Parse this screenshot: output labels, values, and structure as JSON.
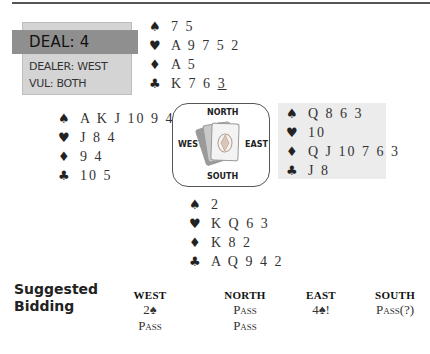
{
  "deal": {
    "title": "DEAL: 4",
    "dealer": "DEALER: WEST",
    "vul": "VUL: BOTH"
  },
  "icons": {
    "spade": "♠",
    "heart": "♥",
    "diamond": "♦",
    "club": "♣"
  },
  "hands": {
    "north": {
      "spades": "7 5",
      "hearts": "A 9 7 5 2",
      "diamonds": "A 5",
      "clubs_prefix": "K 7 6 ",
      "clubs_underlined": "3"
    },
    "west": {
      "spades": "A K J 10 9 4",
      "hearts": "J 8 4",
      "diamonds": "9 4",
      "clubs": "10 5"
    },
    "east": {
      "spades": "Q 8 6 3",
      "hearts": "10",
      "diamonds": "Q J 10 7 6 3",
      "clubs": "J 8"
    },
    "south": {
      "spades": "2",
      "hearts": "K Q 6 3",
      "diamonds": "K 8 2",
      "clubs": "A Q 9 4 2"
    }
  },
  "compass": {
    "north": "NORTH",
    "south": "SOUTH",
    "east": "EAST",
    "west": "WEST"
  },
  "bidding": {
    "title_line1": "Suggested",
    "title_line2": "Bidding",
    "columns": [
      {
        "header": "WEST",
        "bids": [
          "2♠",
          "Pass"
        ]
      },
      {
        "header": "NORTH",
        "bids": [
          "Pass",
          "Pass"
        ]
      },
      {
        "header": "EAST",
        "bids": [
          "4♠!"
        ]
      },
      {
        "header": "SOUTH",
        "bids": [
          "Pass(?)"
        ]
      }
    ]
  },
  "colors": {
    "deal_band": "#8f8f8f",
    "deal_box": "#d4d4d4",
    "east_highlight": "#ececec"
  }
}
